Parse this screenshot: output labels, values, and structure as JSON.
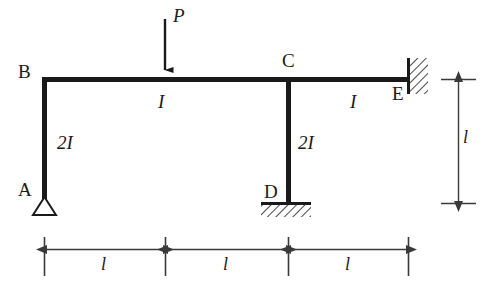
{
  "figure": {
    "type": "structural-frame-diagram",
    "stroke_color": "#1a1a1a",
    "thin_stroke_color": "#444444",
    "background": "#ffffff"
  },
  "joints": {
    "a": {
      "label": "A",
      "support": "pin",
      "x": 44,
      "y": 198
    },
    "b": {
      "label": "B",
      "support": "none",
      "x": 44,
      "y": 79
    },
    "c": {
      "label": "C",
      "support": "none",
      "x": 288,
      "y": 79
    },
    "d": {
      "label": "D",
      "support": "fixed",
      "x": 288,
      "y": 203
    },
    "e": {
      "label": "E",
      "support": "fixed-wall",
      "x": 408,
      "y": 79
    }
  },
  "members": {
    "ab": {
      "stiffness_label": "2I"
    },
    "bc": {
      "stiffness_label": "I"
    },
    "cd": {
      "stiffness_label": "2I"
    },
    "ce": {
      "stiffness_label": "I"
    }
  },
  "load": {
    "label": "P",
    "direction": "down",
    "x": 165,
    "applied_to": "member-bc"
  },
  "dimensions": {
    "horizontal": [
      {
        "label": "l",
        "from_x": 44,
        "to_x": 165
      },
      {
        "label": "l",
        "from_x": 165,
        "to_x": 288
      },
      {
        "label": "l",
        "from_x": 288,
        "to_x": 408
      }
    ],
    "vertical": [
      {
        "label": "l",
        "from_y": 79,
        "to_y": 203
      }
    ]
  }
}
